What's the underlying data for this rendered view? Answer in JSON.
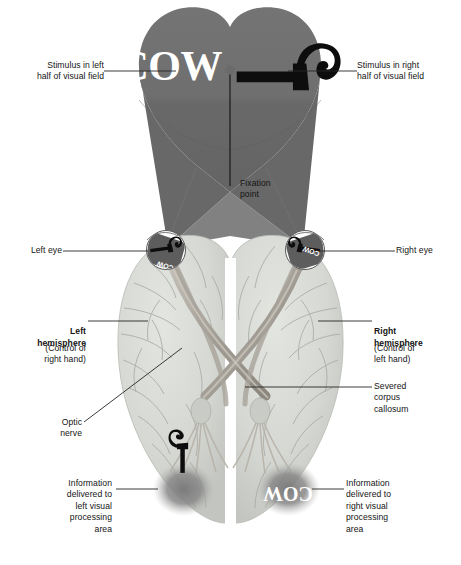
{
  "diagram": {
    "stimulus_word": "COW",
    "stimulus_object_icon": "hammer-icon",
    "colors": {
      "visual_field": "#6e6e6e",
      "visual_field_lower": "#6a6a6a",
      "brain": "#d9dbd6",
      "brain_shade": "#c3c6c1",
      "nerve": "#b4b0a8",
      "nerve_dark": "#8e8a82",
      "text": "#141414",
      "leader_line": "#262626",
      "glow": "#8d8d8d"
    }
  },
  "labels": {
    "stimulus_left": "Stimulus in left\nhalf of visual field",
    "stimulus_right": "Stimulus in right\nhalf of visual field",
    "fixation_point": "Fixation\npoint",
    "left_eye": "Left eye",
    "right_eye": "Right eye",
    "left_hemisphere_title": "Left\nhemisphere",
    "left_hemisphere_sub": "(Control of\nright hand)",
    "right_hemisphere_title": "Right\nhemisphere",
    "right_hemisphere_sub": "(Control of\nleft hand)",
    "optic_nerve": "Optic\nnerve",
    "severed_corpus_callosum": "Severed\ncorpus\ncallosum",
    "info_left": "Information\ndelivered to\nleft visual\nprocessing\narea",
    "info_right": "Information\ndelivered to\nright visual\nprocessing\narea"
  },
  "retina_text": {
    "left_eye_word": "COW",
    "left_eye_object": "hammer-icon",
    "right_eye_word": "COW",
    "right_eye_object": "hammer-icon"
  },
  "cortex_text": {
    "left_visual_area_object": "hammer-icon",
    "right_visual_area_word": "COW"
  }
}
